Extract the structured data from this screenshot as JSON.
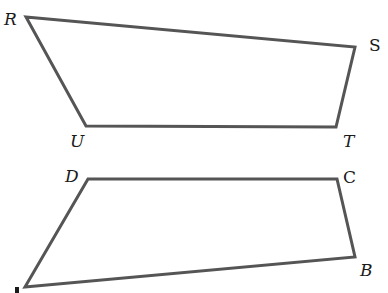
{
  "figure": {
    "line_color": "#555555",
    "label_color": "#1a1a1a"
  },
  "shapes": [
    {
      "name": "quadrilateral-RSTU",
      "vertices": [
        {
          "label": "R",
          "italic": true
        },
        {
          "label": "S",
          "italic": false
        },
        {
          "label": "T",
          "italic": true
        },
        {
          "label": "U",
          "italic": true
        }
      ]
    },
    {
      "name": "quadrilateral-ABCD",
      "vertices": [
        {
          "label": "D",
          "italic": true
        },
        {
          "label": "C",
          "italic": false
        },
        {
          "label": "B",
          "italic": true
        },
        {
          "label": "A",
          "italic": true
        }
      ]
    }
  ]
}
